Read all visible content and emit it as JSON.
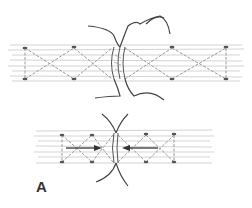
{
  "figure": {
    "panel_label": "A",
    "colors": {
      "tendon_fibers": "#c8c8c8",
      "suture": "#444444",
      "cross_stitch": "#9a9a9a",
      "arrow": "#333333",
      "background": "#ffffff"
    },
    "panels": [
      {
        "name": "upper",
        "state": "ends separated with sutures placed"
      },
      {
        "name": "lower",
        "state": "ends approximated, arrows indicating compression toward repair"
      }
    ]
  }
}
